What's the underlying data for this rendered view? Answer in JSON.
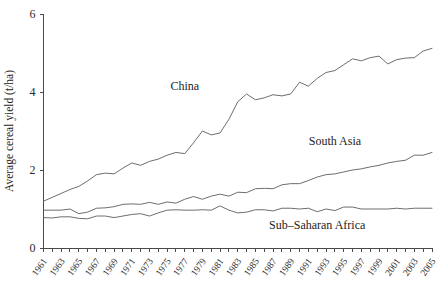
{
  "chart_data": {
    "type": "line",
    "title": "",
    "xlabel": "",
    "ylabel": "Average cereal yield (t/ha)",
    "xlim": [
      1961,
      2005
    ],
    "ylim": [
      0,
      6
    ],
    "yticks": [
      0,
      2,
      4,
      6
    ],
    "ytick_labels": [
      "0",
      "2",
      "4",
      "6"
    ],
    "grid": false,
    "legend_position": "inline-annotations",
    "x": [
      1961,
      1962,
      1963,
      1964,
      1965,
      1966,
      1967,
      1968,
      1969,
      1970,
      1971,
      1972,
      1973,
      1974,
      1975,
      1976,
      1977,
      1978,
      1979,
      1980,
      1981,
      1982,
      1983,
      1984,
      1985,
      1986,
      1987,
      1988,
      1989,
      1990,
      1991,
      1992,
      1993,
      1994,
      1995,
      1996,
      1997,
      1998,
      1999,
      2000,
      2001,
      2002,
      2003,
      2004,
      2005
    ],
    "xtick_values": [
      1961,
      1963,
      1965,
      1967,
      1969,
      1971,
      1973,
      1975,
      1977,
      1979,
      1981,
      1983,
      1985,
      1987,
      1989,
      1991,
      1993,
      1995,
      1997,
      1999,
      2001,
      2003,
      2005
    ],
    "xtick_labels": [
      "1961",
      "1963",
      "1965",
      "1967",
      "1969",
      "1971",
      "1973",
      "1975",
      "1977",
      "1979",
      "1981",
      "1983",
      "1985",
      "1987",
      "1989",
      "1991",
      "1993",
      "1995",
      "1997",
      "1999",
      "2001",
      "2003",
      "2005"
    ],
    "series": [
      {
        "name": "China",
        "label": "China",
        "color": "#5c5c5c",
        "label_x": 1977,
        "label_y": 4.05,
        "values": [
          1.2,
          1.3,
          1.4,
          1.5,
          1.58,
          1.72,
          1.88,
          1.92,
          1.9,
          2.05,
          2.18,
          2.12,
          2.22,
          2.28,
          2.38,
          2.45,
          2.42,
          2.7,
          3.0,
          2.9,
          2.95,
          3.3,
          3.75,
          3.95,
          3.8,
          3.85,
          3.93,
          3.9,
          3.95,
          4.25,
          4.15,
          4.35,
          4.5,
          4.55,
          4.7,
          4.85,
          4.8,
          4.88,
          4.92,
          4.72,
          4.83,
          4.87,
          4.88,
          5.05,
          5.12
        ]
      },
      {
        "name": "South Asia",
        "label": "South Asia",
        "color": "#5c5c5c",
        "label_x": 1994,
        "label_y": 2.65,
        "values": [
          0.97,
          0.97,
          0.97,
          1.0,
          0.88,
          0.92,
          1.02,
          1.03,
          1.06,
          1.12,
          1.13,
          1.12,
          1.17,
          1.12,
          1.18,
          1.15,
          1.25,
          1.32,
          1.25,
          1.33,
          1.38,
          1.33,
          1.43,
          1.42,
          1.52,
          1.53,
          1.52,
          1.62,
          1.65,
          1.65,
          1.73,
          1.82,
          1.88,
          1.9,
          1.95,
          2.0,
          2.03,
          2.08,
          2.12,
          2.18,
          2.22,
          2.25,
          2.38,
          2.38,
          2.45
        ]
      },
      {
        "name": "Sub–Saharan Africa",
        "label": "Sub–Saharan Africa",
        "color": "#5c5c5c",
        "label_x": 1992,
        "label_y": 0.5,
        "values": [
          0.78,
          0.77,
          0.8,
          0.8,
          0.76,
          0.75,
          0.82,
          0.82,
          0.78,
          0.82,
          0.86,
          0.88,
          0.82,
          0.9,
          0.97,
          0.98,
          0.97,
          0.97,
          0.98,
          0.97,
          1.08,
          0.97,
          0.9,
          0.92,
          0.98,
          0.98,
          0.95,
          1.02,
          1.02,
          1.0,
          1.02,
          0.93,
          1.0,
          0.96,
          1.05,
          1.05,
          1.0,
          1.0,
          1.0,
          1.0,
          1.02,
          1.0,
          1.02,
          1.02,
          1.02
        ]
      }
    ]
  }
}
